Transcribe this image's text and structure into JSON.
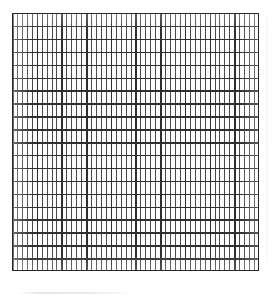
{
  "document": {
    "kind": "graph-paper-scan",
    "title": "Blank graph paper grid",
    "caption": "Scanned sheet of blank rectangular grid / graph paper",
    "background_color": "#ffffff",
    "paper_color": "#fdfdfd"
  },
  "grid": {
    "label": "grid-sheet",
    "left_px": 12,
    "top_px": 13,
    "width_px": 247,
    "height_px": 258,
    "border_color": "#262626",
    "border_width_px": 1.8,
    "major_vertical": {
      "label": "major-vertical-lines",
      "count": 11,
      "spacing_px": 24.7,
      "thickness_px": 1.6,
      "color": "#2e2e2e"
    },
    "major_horizontal": {
      "label": "major-horizontal-lines",
      "count": 21,
      "spacing_px": 12.9,
      "thickness_px": 1.5,
      "color": "#2f2f2f"
    },
    "minor_vertical": {
      "label": "minor-vertical-lines",
      "count": 51,
      "spacing_px": 4.94,
      "thickness_px": 1.0,
      "color": "#4a4a4a",
      "per_major_cell": 5
    },
    "minor_horizontal": {
      "label": "minor-horizontal-lines",
      "count": 0,
      "spacing_px": 0,
      "thickness_px": 0,
      "color": "#4a4a4a",
      "per_major_cell": 1
    },
    "cells": {
      "columns": 10,
      "rows": 20,
      "cell_width_px": 24.7,
      "cell_height_px": 12.9
    }
  },
  "artifacts": {
    "smudge": {
      "label": "paper-smudge",
      "left_px": 18,
      "top_px": 292,
      "width_px": 118,
      "color": "#e4e4e4"
    },
    "right_edge": {
      "label": "sheet-right-edge",
      "left_px": 266,
      "top_px": 6,
      "height_px": 272,
      "color": "#f2f2f2"
    }
  }
}
